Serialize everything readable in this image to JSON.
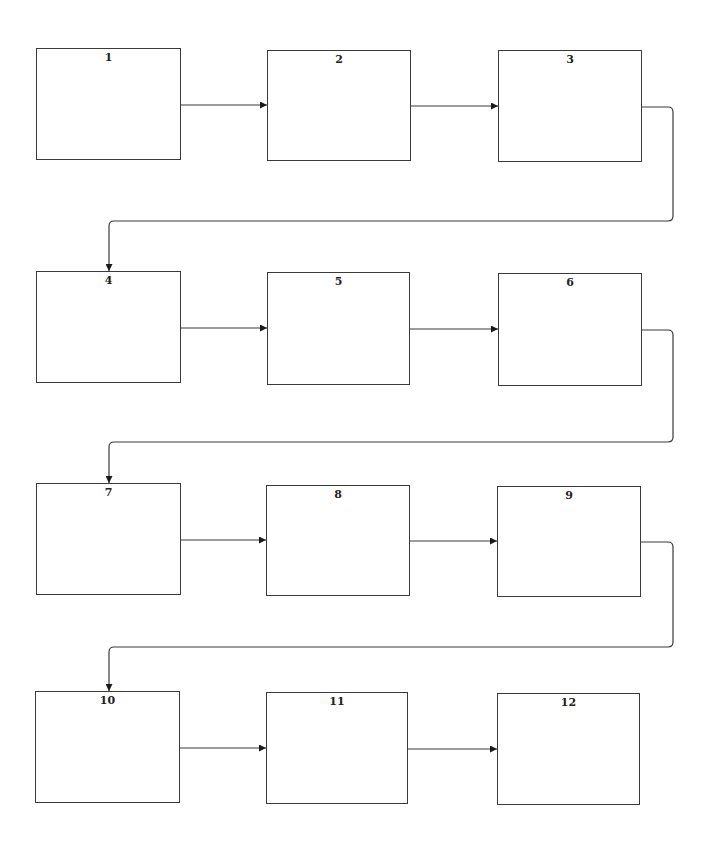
{
  "diagram": {
    "type": "flowchart",
    "direction": "snake rows, left-to-right, wrapping to next row",
    "colors": {
      "stroke": "#3a3a3a",
      "text": "#222222",
      "background": "#ffffff"
    },
    "boxes": [
      {
        "id": "1",
        "label": "1",
        "x": 36,
        "y": 48,
        "w": 145,
        "h": 112
      },
      {
        "id": "2",
        "label": "2",
        "x": 267,
        "y": 50,
        "w": 144,
        "h": 111
      },
      {
        "id": "3",
        "label": "3",
        "x": 498,
        "y": 50,
        "w": 144,
        "h": 112
      },
      {
        "id": "4",
        "label": "4",
        "x": 36,
        "y": 271,
        "w": 145,
        "h": 112
      },
      {
        "id": "5",
        "label": "5",
        "x": 267,
        "y": 272,
        "w": 143,
        "h": 113
      },
      {
        "id": "6",
        "label": "6",
        "x": 498,
        "y": 273,
        "w": 144,
        "h": 113
      },
      {
        "id": "7",
        "label": "7",
        "x": 36,
        "y": 483,
        "w": 145,
        "h": 112
      },
      {
        "id": "8",
        "label": "8",
        "x": 266,
        "y": 485,
        "w": 144,
        "h": 111
      },
      {
        "id": "9",
        "label": "9",
        "x": 497,
        "y": 486,
        "w": 144,
        "h": 111
      },
      {
        "id": "10",
        "label": "10",
        "x": 35,
        "y": 691,
        "w": 145,
        "h": 112
      },
      {
        "id": "11",
        "label": "11",
        "x": 266,
        "y": 692,
        "w": 142,
        "h": 112
      },
      {
        "id": "12",
        "label": "12",
        "x": 497,
        "y": 693,
        "w": 143,
        "h": 112
      }
    ],
    "edges": [
      {
        "from": "1",
        "to": "2",
        "kind": "straight",
        "points": [
          [
            181,
            105
          ],
          [
            267,
            105
          ]
        ]
      },
      {
        "from": "2",
        "to": "3",
        "kind": "straight",
        "points": [
          [
            411,
            106
          ],
          [
            498,
            106
          ]
        ]
      },
      {
        "from": "3",
        "to": "4",
        "kind": "return",
        "points": [
          [
            642,
            107
          ],
          [
            673,
            107
          ],
          [
            673,
            221
          ],
          [
            109,
            221
          ],
          [
            109,
            271
          ]
        ]
      },
      {
        "from": "4",
        "to": "5",
        "kind": "straight",
        "points": [
          [
            181,
            328
          ],
          [
            267,
            328
          ]
        ]
      },
      {
        "from": "5",
        "to": "6",
        "kind": "straight",
        "points": [
          [
            410,
            329
          ],
          [
            498,
            329
          ]
        ]
      },
      {
        "from": "6",
        "to": "7",
        "kind": "return",
        "points": [
          [
            642,
            330
          ],
          [
            673,
            330
          ],
          [
            673,
            442
          ],
          [
            109,
            442
          ],
          [
            109,
            483
          ]
        ]
      },
      {
        "from": "7",
        "to": "8",
        "kind": "straight",
        "points": [
          [
            181,
            540
          ],
          [
            266,
            540
          ]
        ]
      },
      {
        "from": "8",
        "to": "9",
        "kind": "straight",
        "points": [
          [
            410,
            541
          ],
          [
            497,
            541
          ]
        ]
      },
      {
        "from": "9",
        "to": "10",
        "kind": "return",
        "points": [
          [
            641,
            542
          ],
          [
            673,
            542
          ],
          [
            673,
            647
          ],
          [
            109,
            647
          ],
          [
            109,
            691
          ]
        ]
      },
      {
        "from": "10",
        "to": "11",
        "kind": "straight",
        "points": [
          [
            180,
            748
          ],
          [
            266,
            748
          ]
        ]
      },
      {
        "from": "11",
        "to": "12",
        "kind": "straight",
        "points": [
          [
            408,
            749
          ],
          [
            497,
            749
          ]
        ]
      }
    ]
  }
}
